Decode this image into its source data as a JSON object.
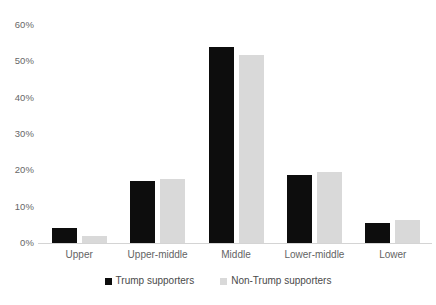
{
  "chart_data": {
    "type": "bar",
    "title": "",
    "xlabel": "",
    "ylabel": "",
    "ylim": [
      0,
      60
    ],
    "ytick_labels": [
      "60%",
      "50%",
      "40%",
      "30%",
      "20%",
      "10%",
      "0%"
    ],
    "ytick_values": [
      60,
      50,
      40,
      30,
      20,
      10,
      0
    ],
    "grid": false,
    "legend_position": "bottom",
    "categories": [
      "Upper",
      "Upper-middle",
      "Middle",
      "Lower-middle",
      "Lower"
    ],
    "series": [
      {
        "name": "Trump supporters",
        "color": "#0d0d0d",
        "values": [
          4.0,
          17.0,
          54.0,
          18.7,
          5.5
        ]
      },
      {
        "name": "Non-Trump supporters",
        "color": "#d9d9d9",
        "values": [
          1.8,
          17.7,
          51.7,
          19.5,
          6.3
        ]
      }
    ]
  }
}
